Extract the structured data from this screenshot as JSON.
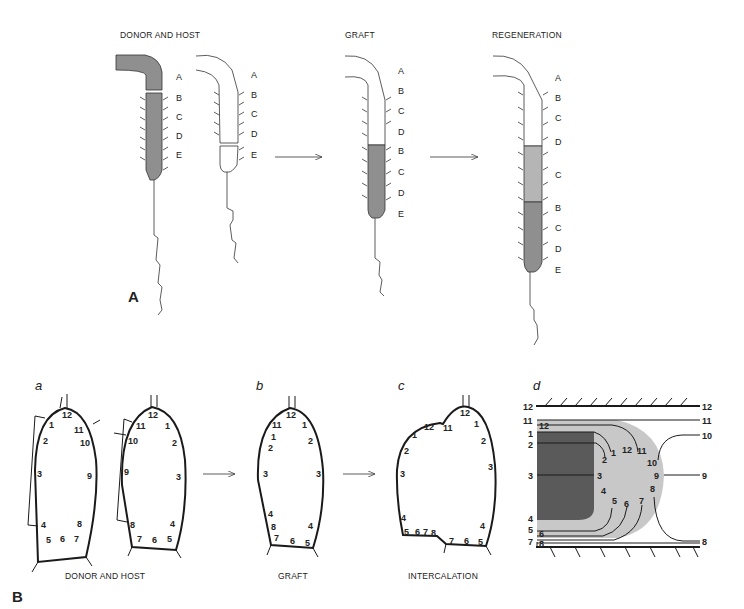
{
  "panel_A": {
    "label": "A",
    "captions": {
      "donor_host": "DONOR AND HOST",
      "graft": "GRAFT",
      "regeneration": "REGENERATION"
    },
    "donor_segments": [
      "A",
      "B",
      "C",
      "D",
      "E"
    ],
    "host_segments": [
      "A",
      "B",
      "C",
      "D",
      "E"
    ],
    "graft_segments": [
      "A",
      "B",
      "C",
      "D",
      "B",
      "C",
      "D",
      "E"
    ],
    "regeneration_segments": [
      "A",
      "B",
      "C",
      "D",
      "C",
      "B",
      "C",
      "D",
      "E"
    ]
  },
  "panel_B": {
    "label": "B",
    "sub_a": {
      "label": "a",
      "caption": "DONOR AND HOST",
      "donor_numbers": [
        "12",
        "1",
        "11",
        "2",
        "10",
        "3",
        "9",
        "4",
        "8",
        "5",
        "6",
        "7"
      ],
      "host_numbers": [
        "12",
        "11",
        "1",
        "10",
        "2",
        "9",
        "3",
        "8",
        "4",
        "7",
        "6",
        "5"
      ]
    },
    "sub_b": {
      "label": "b",
      "caption": "GRAFT",
      "numbers": [
        "12",
        "11",
        "1",
        "1",
        "2",
        "2",
        "3",
        "3",
        "4",
        "8",
        "4",
        "7",
        "6",
        "5"
      ]
    },
    "sub_c": {
      "label": "c",
      "caption": "INTERCALATION",
      "numbers": [
        "12",
        "12",
        "11",
        "1",
        "1",
        "2",
        "2",
        "3",
        "3",
        "4",
        "5",
        "6",
        "7",
        "8",
        "4",
        "7",
        "6",
        "5"
      ]
    },
    "sub_d": {
      "label": "d",
      "left_numbers": [
        "12",
        "11",
        "1",
        "2",
        "3",
        "4",
        "5",
        "6",
        "7",
        "8"
      ],
      "right_numbers": [
        "12",
        "11",
        "10",
        "9",
        "8"
      ],
      "inner_numbers": [
        "12",
        "1",
        "2",
        "3",
        "4",
        "5",
        "6",
        "7",
        "12",
        "11",
        "10",
        "9",
        "8"
      ],
      "colors": {
        "dark": "#5a5a5a",
        "light": "#c8c8c8"
      }
    }
  }
}
